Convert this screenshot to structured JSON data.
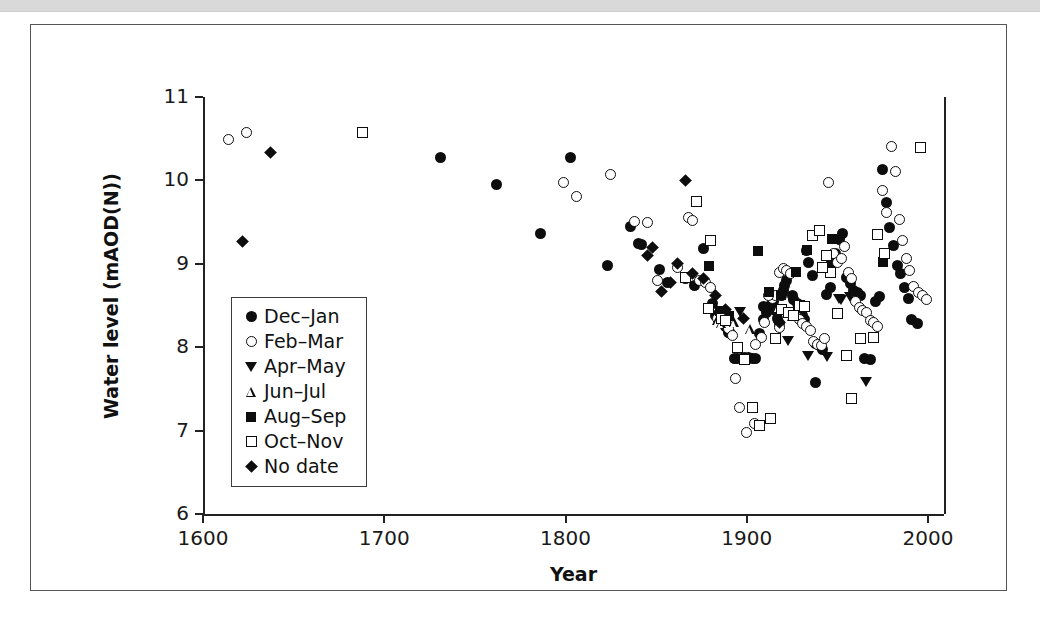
{
  "figure": {
    "ylabel": "Water level (mAOD(N))",
    "xlabel": "Year"
  },
  "legend": {
    "items": [
      {
        "label": "Dec–Jan",
        "marker": "filled-circle"
      },
      {
        "label": "Feb–Mar",
        "marker": "open-circle"
      },
      {
        "label": "Apr–May",
        "marker": "filled-triangle-down"
      },
      {
        "label": "Jun–Jul",
        "marker": "open-triangle-up"
      },
      {
        "label": "Aug–Sep",
        "marker": "filled-square"
      },
      {
        "label": "Oct–Nov",
        "marker": "open-square"
      },
      {
        "label": "No date",
        "marker": "filled-diamond"
      }
    ]
  },
  "chart_data": {
    "type": "scatter",
    "title": "",
    "xlabel": "Year",
    "ylabel": "Water level (mAOD(N))",
    "xlim": [
      1600,
      2010
    ],
    "ylim": [
      6,
      11
    ],
    "xticks": [
      1600,
      1700,
      1800,
      1900,
      2000
    ],
    "yticks": [
      6,
      7,
      8,
      9,
      10,
      11
    ],
    "grid": false,
    "legend_position": "inside-left",
    "marker_colors": {
      "fill": "#0d0d0d",
      "open": "#ffffff",
      "edge": "#0d0d0d"
    },
    "series": [
      {
        "name": "Dec–Jan",
        "marker": "filled-circle",
        "points": [
          [
            1731,
            10.28
          ],
          [
            1762,
            9.95
          ],
          [
            1803,
            10.28
          ],
          [
            1786,
            9.36
          ],
          [
            1823,
            8.98
          ],
          [
            1836,
            9.45
          ],
          [
            1840,
            9.24
          ],
          [
            1842,
            9.23
          ],
          [
            1852,
            8.93
          ],
          [
            1856,
            8.78
          ],
          [
            1866,
            8.82
          ],
          [
            1871,
            8.74
          ],
          [
            1876,
            9.18
          ],
          [
            1881,
            8.52
          ],
          [
            1883,
            8.38
          ],
          [
            1886,
            8.43
          ],
          [
            1888,
            8.25
          ],
          [
            1890,
            8.18
          ],
          [
            1893,
            7.86
          ],
          [
            1895,
            7.87
          ],
          [
            1897,
            7.87
          ],
          [
            1899,
            7.88
          ],
          [
            1901,
            7.88
          ],
          [
            1903,
            7.87
          ],
          [
            1905,
            7.86
          ],
          [
            1907,
            8.17
          ],
          [
            1909,
            8.33
          ],
          [
            1911,
            8.42
          ],
          [
            1912,
            8.45
          ],
          [
            1913,
            8.5
          ],
          [
            1914,
            8.5
          ],
          [
            1915,
            8.55
          ],
          [
            1916,
            8.44
          ],
          [
            1917,
            8.35
          ],
          [
            1918,
            8.28
          ],
          [
            1919,
            8.62
          ],
          [
            1920,
            8.68
          ],
          [
            1921,
            8.74
          ],
          [
            1922,
            8.8
          ],
          [
            1924,
            8.9
          ],
          [
            1926,
            8.57
          ],
          [
            1928,
            8.52
          ],
          [
            1929,
            8.45
          ],
          [
            1931,
            8.38
          ],
          [
            1932,
            8.33
          ],
          [
            1933,
            9.16
          ],
          [
            1934,
            9.01
          ],
          [
            1936,
            8.86
          ],
          [
            1938,
            8.05
          ],
          [
            1940,
            8.02
          ],
          [
            1942,
            7.97
          ],
          [
            1944,
            8.63
          ],
          [
            1946,
            8.71
          ],
          [
            1947,
            9.02
          ],
          [
            1949,
            9.12
          ],
          [
            1951,
            9.29
          ],
          [
            1953,
            9.36
          ],
          [
            1955,
            8.83
          ],
          [
            1957,
            8.76
          ],
          [
            1959,
            8.68
          ],
          [
            1961,
            8.66
          ],
          [
            1963,
            8.62
          ],
          [
            1965,
            7.86
          ],
          [
            1968,
            7.85
          ],
          [
            1971,
            8.55
          ],
          [
            1973,
            8.61
          ],
          [
            1975,
            10.13
          ],
          [
            1977,
            9.73
          ],
          [
            1979,
            9.44
          ],
          [
            1981,
            9.22
          ],
          [
            1983,
            8.98
          ],
          [
            1985,
            8.88
          ],
          [
            1987,
            8.72
          ],
          [
            1989,
            8.58
          ],
          [
            1991,
            8.33
          ],
          [
            1994,
            8.28
          ],
          [
            1938,
            7.58
          ],
          [
            1925,
            8.62
          ],
          [
            1909,
            8.49
          ],
          [
            1891,
            8.17
          ]
        ]
      },
      {
        "name": "Feb–Mar",
        "marker": "open-circle",
        "points": [
          [
            1614,
            10.49
          ],
          [
            1624,
            10.57
          ],
          [
            1799,
            9.98
          ],
          [
            1806,
            9.81
          ],
          [
            1825,
            10.07
          ],
          [
            1838,
            9.51
          ],
          [
            1845,
            9.5
          ],
          [
            1851,
            8.8
          ],
          [
            1862,
            8.96
          ],
          [
            1868,
            9.55
          ],
          [
            1870,
            9.52
          ],
          [
            1874,
            8.8
          ],
          [
            1877,
            8.78
          ],
          [
            1880,
            8.72
          ],
          [
            1884,
            8.35
          ],
          [
            1887,
            8.3
          ],
          [
            1890,
            8.22
          ],
          [
            1892,
            8.14
          ],
          [
            1894,
            7.62
          ],
          [
            1896,
            7.28
          ],
          [
            1900,
            6.98
          ],
          [
            1904,
            7.09
          ],
          [
            1908,
            8.12
          ],
          [
            1910,
            8.3
          ],
          [
            1914,
            8.58
          ],
          [
            1916,
            8.62
          ],
          [
            1918,
            8.9
          ],
          [
            1920,
            8.94
          ],
          [
            1922,
            8.92
          ],
          [
            1924,
            8.88
          ],
          [
            1927,
            8.38
          ],
          [
            1929,
            8.33
          ],
          [
            1931,
            8.28
          ],
          [
            1933,
            8.25
          ],
          [
            1935,
            8.2
          ],
          [
            1937,
            8.07
          ],
          [
            1939,
            8.03
          ],
          [
            1941,
            8.02
          ],
          [
            1943,
            8.1
          ],
          [
            1945,
            9.97
          ],
          [
            1948,
            9.12
          ],
          [
            1950,
            9.02
          ],
          [
            1952,
            9.06
          ],
          [
            1954,
            9.21
          ],
          [
            1956,
            8.9
          ],
          [
            1958,
            8.82
          ],
          [
            1960,
            8.55
          ],
          [
            1962,
            8.48
          ],
          [
            1964,
            8.44
          ],
          [
            1966,
            8.42
          ],
          [
            1968,
            8.32
          ],
          [
            1970,
            8.3
          ],
          [
            1972,
            8.25
          ],
          [
            1975,
            9.88
          ],
          [
            1977,
            9.62
          ],
          [
            1980,
            10.41
          ],
          [
            1982,
            10.11
          ],
          [
            1984,
            9.53
          ],
          [
            1986,
            9.28
          ],
          [
            1988,
            9.06
          ],
          [
            1990,
            8.92
          ],
          [
            1992,
            8.73
          ],
          [
            1995,
            8.66
          ],
          [
            1997,
            8.62
          ],
          [
            1999,
            8.57
          ],
          [
            1912,
            8.62
          ],
          [
            1918,
            8.24
          ],
          [
            1905,
            8.03
          ]
        ]
      },
      {
        "name": "Apr–May",
        "marker": "filled-triangle-down",
        "points": [
          [
            1923,
            8.08
          ],
          [
            1934,
            7.9
          ],
          [
            1951,
            8.58
          ],
          [
            1957,
            8.6
          ],
          [
            1966,
            7.58
          ],
          [
            1944,
            7.88
          ],
          [
            1952,
            8.56
          ],
          [
            1896,
            8.42
          ]
        ]
      },
      {
        "name": "Jun–Jul",
        "marker": "open-triangle-up",
        "points": [
          [
            1884,
            8.33
          ],
          [
            1886,
            8.29
          ],
          [
            1902,
            8.22
          ],
          [
            1917,
            8.48
          ],
          [
            1925,
            8.38
          ],
          [
            1893,
            8.3
          ]
        ]
      },
      {
        "name": "Aug–Sep",
        "marker": "filled-square",
        "points": [
          [
            1879,
            8.97
          ],
          [
            1885,
            8.44
          ],
          [
            1890,
            8.38
          ],
          [
            1906,
            9.15
          ],
          [
            1912,
            8.66
          ],
          [
            1927,
            8.9
          ],
          [
            1933,
            9.17
          ],
          [
            1947,
            9.3
          ],
          [
            1975,
            9.02
          ],
          [
            1887,
            8.36
          ],
          [
            1919,
            8.63
          ]
        ]
      },
      {
        "name": "Oct–Nov",
        "marker": "open-square",
        "points": [
          [
            1688,
            10.57
          ],
          [
            1872,
            9.75
          ],
          [
            1866,
            8.83
          ],
          [
            1879,
            8.47
          ],
          [
            1886,
            8.34
          ],
          [
            1888,
            8.32
          ],
          [
            1895,
            8.0
          ],
          [
            1899,
            7.85
          ],
          [
            1903,
            7.28
          ],
          [
            1907,
            7.06
          ],
          [
            1913,
            7.15
          ],
          [
            1919,
            8.45
          ],
          [
            1923,
            8.42
          ],
          [
            1929,
            8.5
          ],
          [
            1932,
            8.49
          ],
          [
            1936,
            9.34
          ],
          [
            1940,
            9.4
          ],
          [
            1944,
            9.1
          ],
          [
            1946,
            8.9
          ],
          [
            1950,
            8.4
          ],
          [
            1955,
            7.9
          ],
          [
            1958,
            7.39
          ],
          [
            1963,
            8.11
          ],
          [
            1972,
            9.35
          ],
          [
            1976,
            9.12
          ],
          [
            1996,
            10.4
          ],
          [
            1880,
            9.28
          ],
          [
            1916,
            8.11
          ],
          [
            1926,
            8.38
          ],
          [
            1942,
            8.96
          ],
          [
            1970,
            8.12
          ]
        ]
      },
      {
        "name": "No date",
        "marker": "filled-diamond",
        "points": [
          [
            1622,
            9.27
          ],
          [
            1637,
            10.33
          ],
          [
            1866,
            10.0
          ],
          [
            1848,
            9.2
          ],
          [
            1845,
            9.1
          ],
          [
            1853,
            8.67
          ],
          [
            1858,
            8.78
          ],
          [
            1862,
            9.0
          ],
          [
            1870,
            8.88
          ],
          [
            1876,
            8.82
          ],
          [
            1898,
            8.35
          ],
          [
            1918,
            8.3
          ],
          [
            1883,
            8.62
          ],
          [
            1888,
            8.45
          ]
        ]
      }
    ]
  }
}
